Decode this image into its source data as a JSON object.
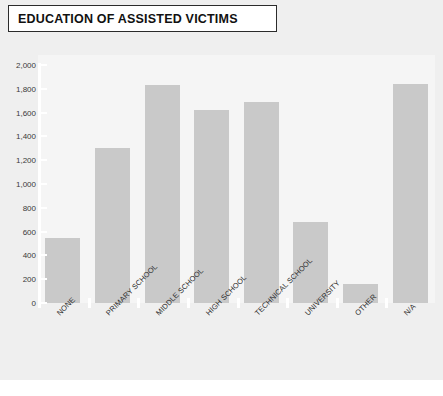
{
  "title": "EDUCATION OF ASSISTED VICTIMS",
  "colors": {
    "bar_fill": "#c9c9c9",
    "plot_background": "#f5f5f5",
    "panel_background": "#efefef",
    "title_border": "#2b2b2b",
    "title_text": "#111111",
    "axis_line": "#ffffff"
  },
  "chart_data": {
    "type": "bar",
    "title": "EDUCATION OF ASSISTED VICTIMS",
    "xlabel": "",
    "ylabel": "",
    "ylim": [
      0,
      2000
    ],
    "grid": false,
    "legend": "none",
    "y_ticks": [
      "0",
      "200",
      "400",
      "600",
      "800",
      "1,000",
      "1,200",
      "1,400",
      "1,600",
      "1,800",
      "2,000"
    ],
    "y_tick_values": [
      0,
      200,
      400,
      600,
      800,
      1000,
      1200,
      1400,
      1600,
      1800,
      2000
    ],
    "categories": [
      "NONE",
      "PRIMARY SCHOOL",
      "MIDDLE SCHOOL",
      "HIGH SCHOOL",
      "TECHNICAL SCHOOL",
      "UNIVERSITY",
      "OTHER",
      "N/A"
    ],
    "values": [
      550,
      1300,
      1830,
      1620,
      1690,
      680,
      160,
      1840
    ]
  }
}
